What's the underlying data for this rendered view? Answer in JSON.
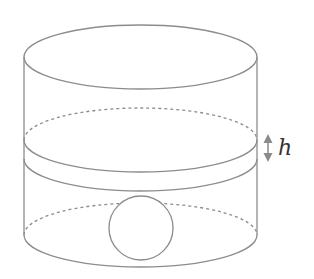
{
  "diagram": {
    "type": "cylinder-with-sphere",
    "labels": {
      "height_label": "h"
    },
    "colors": {
      "stroke": "#8c8c8c",
      "arrow": "#8a8a8a",
      "label": "#333333",
      "background": "#ffffff"
    },
    "elements": [
      {
        "name": "cylinder-top-ellipse",
        "style": "solid"
      },
      {
        "name": "upper-dashed-ellipse",
        "style": "dashed"
      },
      {
        "name": "water-level-upper-arc",
        "style": "solid"
      },
      {
        "name": "water-level-lower-arc",
        "style": "solid"
      },
      {
        "name": "sphere",
        "style": "solid"
      },
      {
        "name": "lower-dashed-ellipse",
        "style": "dashed"
      },
      {
        "name": "cylinder-bottom-arc",
        "style": "solid"
      },
      {
        "name": "height-arrow",
        "style": "double-headed"
      }
    ]
  }
}
